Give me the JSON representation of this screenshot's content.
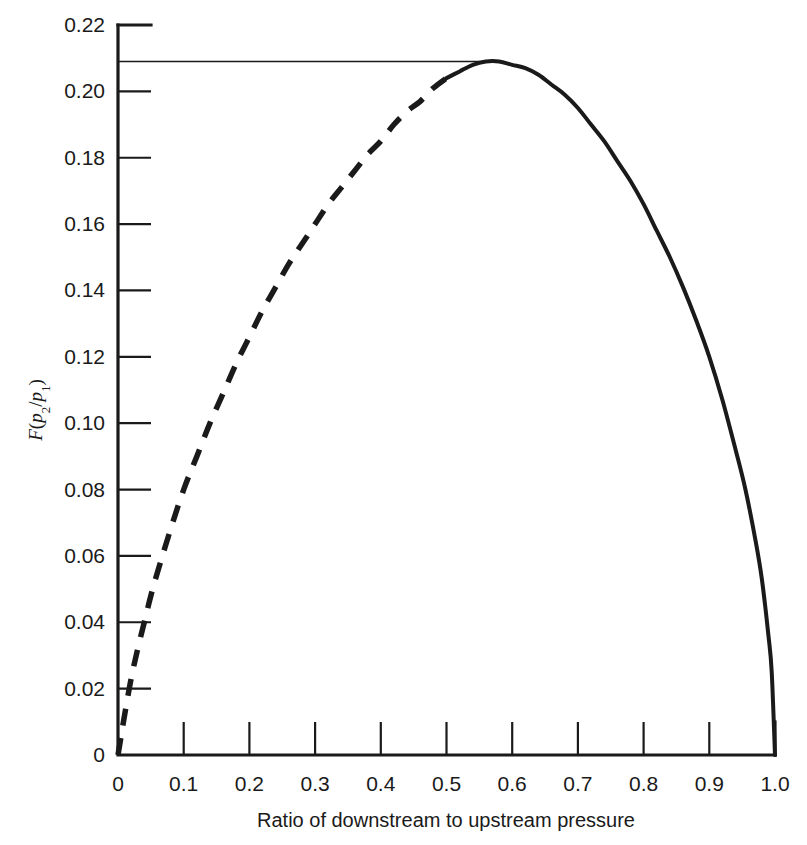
{
  "chart_data": {
    "type": "line",
    "title": "",
    "xlabel": "Ratio of downstream to upstream pressure",
    "ylabel": "F(p2/p1)",
    "ylabel_parts": {
      "f": "F",
      "open": "(",
      "p_a": "p",
      "sub_a": "2",
      "slash": "/",
      "p_b": "p",
      "sub_b": "1",
      "close": ")"
    },
    "xlim": [
      0,
      1.0
    ],
    "ylim": [
      0,
      0.22
    ],
    "grid": false,
    "legend": "none",
    "x_ticks": [
      0,
      0.1,
      0.2,
      0.3,
      0.4,
      0.5,
      0.6,
      0.7,
      0.8,
      0.9,
      1.0
    ],
    "x_tick_labels": [
      "0",
      "0.1",
      "0.2",
      "0.3",
      "0.4",
      "0.5",
      "0.6",
      "0.7",
      "0.8",
      "0.9",
      "1.0"
    ],
    "y_ticks": [
      0,
      0.02,
      0.04,
      0.06,
      0.08,
      0.1,
      0.12,
      0.14,
      0.16,
      0.18,
      0.2,
      0.22
    ],
    "y_tick_labels": [
      "0",
      "0.02",
      "0.04",
      "0.06",
      "0.08",
      "0.10",
      "0.12",
      "0.14",
      "0.16",
      "0.18",
      "0.20",
      "0.22"
    ],
    "annotations": [
      {
        "name": "peak-reference-line",
        "type": "horizontal-line",
        "y": 0.209,
        "x_from": 0.0,
        "x_to": 0.55,
        "style": "thin-solid"
      }
    ],
    "series": [
      {
        "name": "flow-function-dashed",
        "style": "dashed",
        "comment": "unattainable / extrapolated branch below critical pressure ratio",
        "x": [
          0.0,
          0.005,
          0.01,
          0.02,
          0.03,
          0.04,
          0.05,
          0.06,
          0.08,
          0.1,
          0.12,
          0.14,
          0.16,
          0.18,
          0.2,
          0.22,
          0.24,
          0.26,
          0.28,
          0.3,
          0.32,
          0.34,
          0.36,
          0.38,
          0.4,
          0.42,
          0.44,
          0.46,
          0.48,
          0.5
        ],
        "y": [
          0.0,
          0.006,
          0.012,
          0.023,
          0.032,
          0.04,
          0.048,
          0.055,
          0.068,
          0.08,
          0.09,
          0.1,
          0.109,
          0.118,
          0.126,
          0.134,
          0.141,
          0.148,
          0.154,
          0.16,
          0.166,
          0.171,
          0.176,
          0.181,
          0.185,
          0.19,
          0.194,
          0.197,
          0.201,
          0.204
        ]
      },
      {
        "name": "flow-function-solid",
        "style": "solid",
        "comment": "physically realised branch from critical pressure ratio to unity",
        "x": [
          0.5,
          0.52,
          0.54,
          0.56,
          0.58,
          0.6,
          0.62,
          0.64,
          0.66,
          0.68,
          0.7,
          0.72,
          0.74,
          0.76,
          0.78,
          0.8,
          0.82,
          0.84,
          0.86,
          0.88,
          0.9,
          0.92,
          0.94,
          0.955,
          0.97,
          0.98,
          0.99,
          0.995,
          1.0
        ],
        "y": [
          0.204,
          0.206,
          0.208,
          0.209,
          0.209,
          0.208,
          0.207,
          0.205,
          0.202,
          0.199,
          0.195,
          0.19,
          0.185,
          0.179,
          0.173,
          0.166,
          0.158,
          0.15,
          0.141,
          0.131,
          0.12,
          0.107,
          0.092,
          0.08,
          0.065,
          0.053,
          0.036,
          0.025,
          0.0
        ]
      }
    ]
  }
}
